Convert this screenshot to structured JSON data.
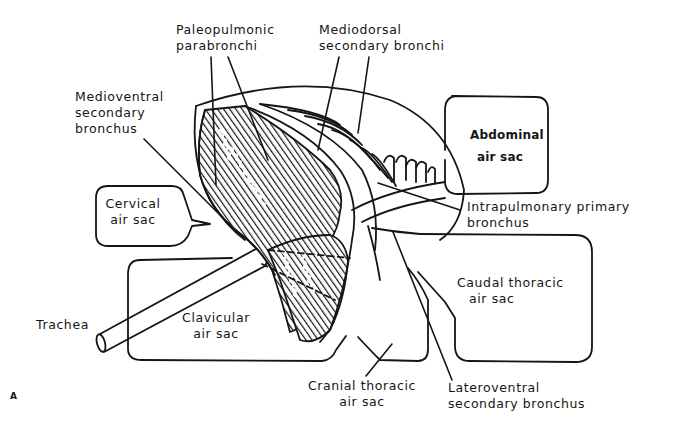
{
  "figure": {
    "panel_label": "A",
    "labels": {
      "paleopulmonic": [
        "Paleopulmonic",
        "parabronchi"
      ],
      "mediodorsal": [
        "Mediodorsal",
        "secondary  bronchi"
      ],
      "medioventral": [
        "Medioventral",
        "secondary",
        "bronchus"
      ],
      "cervical": [
        "Cervical",
        "air  sac"
      ],
      "abdominal": [
        "Abdominal",
        "air sac"
      ],
      "intrapulmonary": [
        "Intrapulmonary   primary",
        "bronchus"
      ],
      "caudal_thoracic": [
        "Caudal thoracic",
        "air sac"
      ],
      "clavicular": [
        "Clavicular",
        "air  sac"
      ],
      "trachea": [
        "Trachea"
      ],
      "cranial_thoracic": [
        "Cranial thoracic",
        "air sac"
      ],
      "lateroventral": [
        "Lateroventral",
        "secondary bronchus"
      ]
    }
  },
  "colors": {
    "ink": "#151515",
    "background": "#ffffff"
  }
}
